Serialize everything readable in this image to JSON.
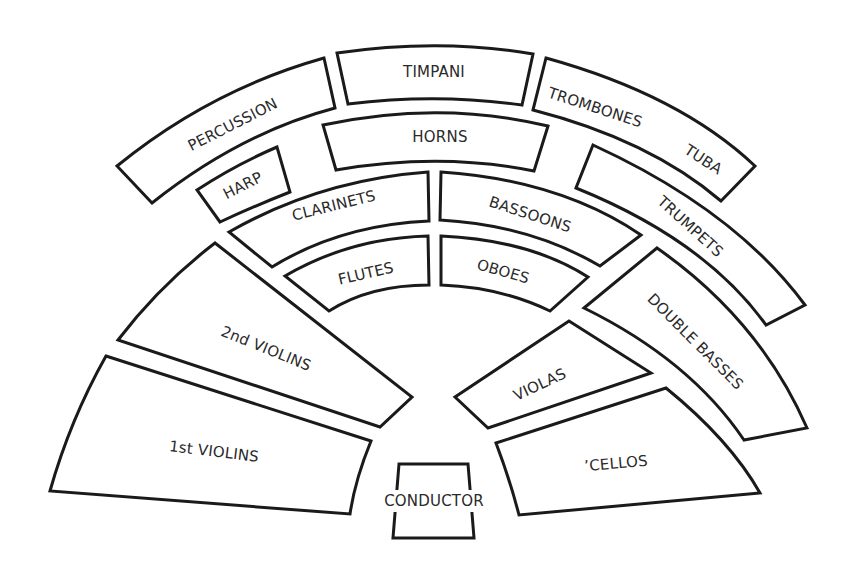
{
  "diagram": {
    "type": "orchestra-seating-chart",
    "colors": {
      "background": "#ffffff",
      "outline": "#1a1a1a",
      "text": "#2a2a2a"
    },
    "sections": {
      "percussion": "PERCUSSION",
      "timpani": "TIMPANI",
      "trombones": "TROMBONES",
      "tuba": "TUBA",
      "harp": "HARP",
      "horns": "HORNS",
      "trumpets": "TRUMPETS",
      "clarinets": "CLARINETS",
      "bassoons": "BASSOONS",
      "flutes": "FLUTES",
      "oboes": "OBOES",
      "second_violins": "2nd VIOLINS",
      "first_violins": "1st VIOLINS",
      "violas": "VIOLAS",
      "double_basses": "DOUBLE BASSES",
      "cellos": "’CELLOS",
      "conductor": "CONDUCTOR"
    }
  }
}
